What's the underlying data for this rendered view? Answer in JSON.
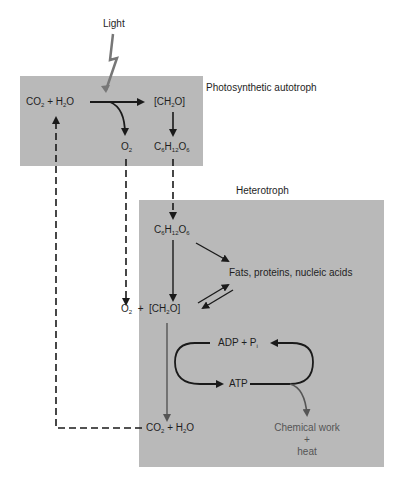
{
  "diagram": {
    "light_label": "Light",
    "autotroph": {
      "title": "Photosynthetic autotroph",
      "reactants": {
        "co2": "CO",
        "co2_sub": "2",
        "plus": "+",
        "h2o_h": "H",
        "h2o_sub": "2",
        "h2o_o": "O"
      },
      "carbohydrate": {
        "pre": "[CH",
        "sub": "2",
        "post": "O]"
      },
      "oxygen": {
        "o": "O",
        "sub": "2"
      },
      "glucose": {
        "c": "C",
        "c_sub": "6",
        "h": "H",
        "h_sub": "12",
        "o": "O",
        "o_sub": "6"
      }
    },
    "heterotroph": {
      "title": "Heterotroph",
      "glucose": {
        "c": "C",
        "c_sub": "6",
        "h": "H",
        "h_sub": "12",
        "o": "O",
        "o_sub": "6"
      },
      "macromolecules": "Fats, proteins, nucleic acids",
      "oxygen": {
        "o": "O",
        "sub": "2"
      },
      "plus": "+",
      "carbohydrate": {
        "pre": "[CH",
        "sub": "2",
        "post": "O]"
      },
      "adp": {
        "text": "ADP + P",
        "sub": "i"
      },
      "atp": "ATP",
      "products": {
        "co2": "CO",
        "co2_sub": "2",
        "plus": "+",
        "h2o_h": "H",
        "h2o_sub": "2",
        "h2o_o": "O"
      },
      "work": {
        "line1": "Chemical work",
        "line2": "+",
        "line3": "heat"
      }
    },
    "colors": {
      "box": "#b9b9b9",
      "arrow": "#1a1a1a",
      "lightning": "#777777"
    }
  }
}
